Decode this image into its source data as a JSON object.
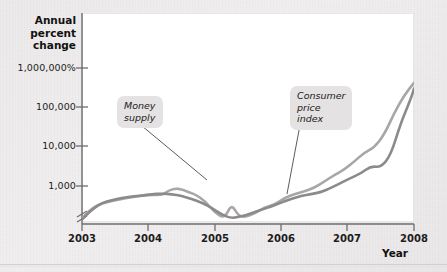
{
  "chart_data": {
    "type": "line",
    "title": "",
    "xlabel": "Year",
    "ylabel": "Annual percent change",
    "ylabel_lines": [
      "Annual",
      "percent",
      "change"
    ],
    "y_scale": "log",
    "y_axis_break": true,
    "grid": false,
    "legend_position": "inline-annotations",
    "yticks": [
      "1,000,000%",
      "100,000",
      "10,000",
      "1,000"
    ],
    "ytick_values": [
      1000000,
      100000,
      10000,
      1000
    ],
    "xticks": [
      "2003",
      "2004",
      "2005",
      "2006",
      "2007",
      "2008"
    ],
    "xlim": [
      2003,
      2008
    ],
    "ylim": [
      100,
      4000000
    ],
    "series": [
      {
        "name": "Money supply",
        "color": "#a8a6a6",
        "x": [
          2003.0,
          2003.1,
          2003.2,
          2003.3,
          2003.45,
          2003.6,
          2003.75,
          2003.9,
          2004.05,
          2004.2,
          2004.3,
          2004.4,
          2004.5,
          2004.6,
          2004.7,
          2004.85,
          2005.0,
          2005.15,
          2005.25,
          2005.35,
          2005.45,
          2005.6,
          2005.75,
          2005.9,
          2006.05,
          2006.2,
          2006.35,
          2006.5,
          2006.65,
          2006.8,
          2006.95,
          2007.1,
          2007.25,
          2007.4,
          2007.55,
          2007.7,
          2007.85,
          2008.0
        ],
        "values": [
          150,
          230,
          300,
          360,
          420,
          470,
          520,
          560,
          600,
          580,
          760,
          860,
          830,
          700,
          620,
          420,
          210,
          150,
          350,
          180,
          160,
          200,
          290,
          330,
          500,
          620,
          740,
          900,
          1300,
          1900,
          2600,
          4200,
          7000,
          9500,
          20000,
          70000,
          200000,
          420000
        ]
      },
      {
        "name": "Consumer price index",
        "color": "#8c8a8a",
        "x": [
          2003.0,
          2003.1,
          2003.2,
          2003.3,
          2003.45,
          2003.6,
          2003.75,
          2003.9,
          2004.05,
          2004.2,
          2004.35,
          2004.5,
          2004.65,
          2004.8,
          2004.95,
          2005.1,
          2005.25,
          2005.4,
          2005.55,
          2005.7,
          2005.85,
          2006.0,
          2006.15,
          2006.3,
          2006.45,
          2006.6,
          2006.75,
          2006.9,
          2007.05,
          2007.2,
          2007.35,
          2007.5,
          2007.65,
          2007.8,
          2007.95,
          2008.0
        ],
        "values": [
          140,
          210,
          290,
          370,
          440,
          500,
          540,
          570,
          620,
          640,
          620,
          560,
          470,
          380,
          280,
          190,
          150,
          170,
          200,
          250,
          300,
          380,
          470,
          560,
          620,
          700,
          900,
          1200,
          1600,
          2100,
          3200,
          3000,
          6000,
          40000,
          160000,
          300000
        ]
      }
    ],
    "annotations": [
      {
        "name": "money-supply",
        "text": "Money\nsupply",
        "leader_from": [
          136,
          121
        ],
        "leader_to": [
          207,
          180
        ]
      },
      {
        "name": "consumer-price-index",
        "text": "Consumer\nprice\nindex",
        "leader_from": [
          300,
          125
        ],
        "leader_to": [
          287,
          194
        ]
      }
    ]
  }
}
